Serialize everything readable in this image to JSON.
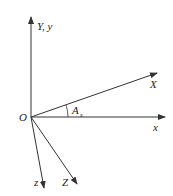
{
  "diagram": {
    "origin_label": "O",
    "axes": [
      {
        "id": "Y_y",
        "label": "Y, y",
        "direction": "up"
      },
      {
        "id": "x",
        "label": "x",
        "direction": "right"
      },
      {
        "id": "X",
        "label": "X",
        "direction": "up-right"
      },
      {
        "id": "z",
        "label": "z",
        "direction": "down"
      },
      {
        "id": "Z",
        "label": "Z",
        "direction": "down-right"
      }
    ],
    "angle": {
      "label": "A",
      "subscript": "s",
      "between": [
        "x",
        "X"
      ]
    },
    "colors": {
      "line": "#333333",
      "text": "#222222",
      "background": "#ffffff"
    }
  }
}
